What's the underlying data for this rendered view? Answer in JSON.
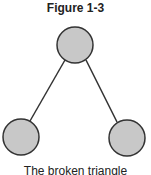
{
  "figure": {
    "title": "Figure 1-3",
    "caption": "The broken triangle"
  },
  "diagram": {
    "node_fill": "#c8c8c8",
    "node_stroke": "#333333",
    "nodes": [
      {
        "id": "top",
        "cx": 75,
        "cy": 45,
        "r": 18
      },
      {
        "id": "left",
        "cx": 21,
        "cy": 137,
        "r": 18
      },
      {
        "id": "right",
        "cx": 127,
        "cy": 138,
        "r": 18
      }
    ],
    "edges": [
      {
        "from": "top",
        "to": "left"
      },
      {
        "from": "top",
        "to": "right"
      }
    ]
  }
}
